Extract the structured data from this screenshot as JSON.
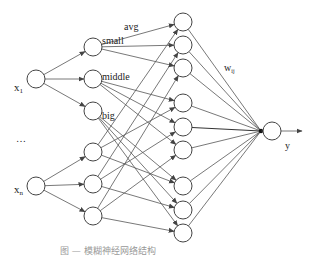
{
  "diagram": {
    "type": "fuzzy-neural-network",
    "inputs": [
      {
        "id": "x1",
        "label": "x",
        "sub": "1",
        "cx": 36,
        "cy": 79
      },
      {
        "id": "xn",
        "label": "x",
        "sub": "n",
        "cx": 36,
        "cy": 186
      }
    ],
    "ellipsis": "…",
    "membership_labels": [
      "small",
      "middle",
      "big"
    ],
    "membership_nodes": [
      {
        "cx": 93,
        "cy": 47
      },
      {
        "cx": 93,
        "cy": 79
      },
      {
        "cx": 93,
        "cy": 111
      },
      {
        "cx": 93,
        "cy": 152
      },
      {
        "cx": 93,
        "cy": 184
      },
      {
        "cx": 93,
        "cy": 216
      }
    ],
    "rule_nodes": [
      {
        "cx": 183,
        "cy": 22
      },
      {
        "cx": 183,
        "cy": 45
      },
      {
        "cx": 183,
        "cy": 68
      },
      {
        "cx": 183,
        "cy": 103
      },
      {
        "cx": 183,
        "cy": 127
      },
      {
        "cx": 183,
        "cy": 150
      },
      {
        "cx": 183,
        "cy": 186
      },
      {
        "cx": 183,
        "cy": 210
      },
      {
        "cx": 183,
        "cy": 233
      }
    ],
    "output": {
      "label": "y",
      "cx": 272,
      "cy": 131
    },
    "labels": {
      "avg": "avg",
      "weight": "w",
      "weight_sub": "ij",
      "output": "y"
    },
    "caption": "图 — 模糊神经网络结构"
  }
}
